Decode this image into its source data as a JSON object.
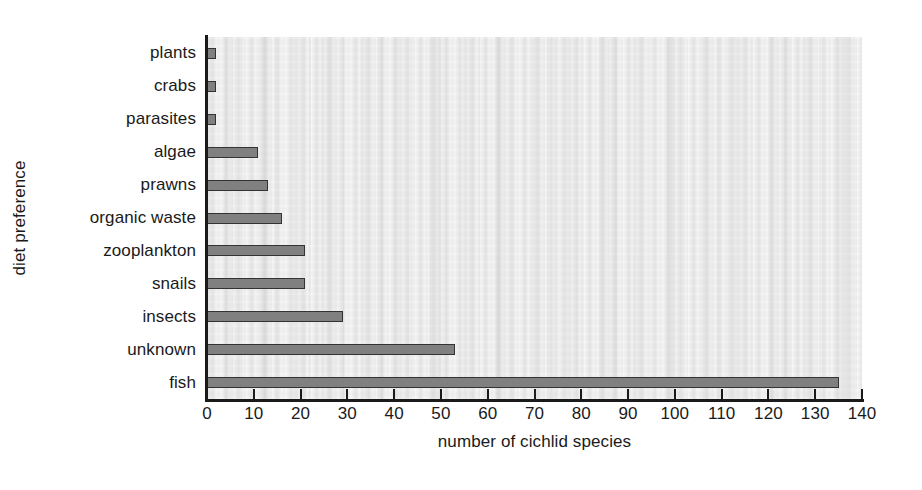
{
  "chart_data": {
    "type": "bar",
    "orientation": "horizontal",
    "title": "",
    "xlabel": "number of cichlid species",
    "ylabel": "diet preference",
    "categories": [
      "plants",
      "crabs",
      "parasites",
      "algae",
      "prawns",
      "organic waste",
      "zooplankton",
      "snails",
      "insects",
      "unknown",
      "fish"
    ],
    "values": [
      2,
      2,
      2,
      11,
      13,
      16,
      21,
      21,
      29,
      53,
      135
    ],
    "xlim": [
      0,
      140
    ],
    "xticks": [
      0,
      10,
      20,
      30,
      40,
      50,
      60,
      70,
      80,
      90,
      100,
      110,
      120,
      130,
      140
    ],
    "xtick_labels": [
      "0",
      "10",
      "20",
      "30",
      "40",
      "50",
      "60",
      "70",
      "80",
      "90",
      "100",
      "110",
      "120",
      "130",
      "140"
    ],
    "grid": false,
    "legend": null,
    "bar_color": "#808080",
    "bar_edge_color": "#333333",
    "plot_background": "#ebebeb",
    "axis_color": "#1a1a1a"
  }
}
